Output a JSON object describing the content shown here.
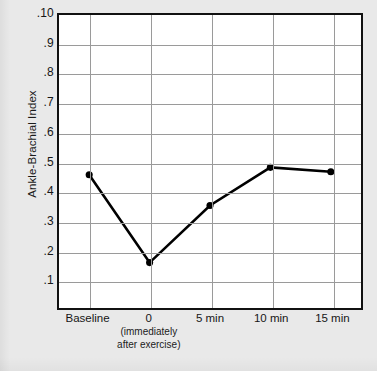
{
  "chart_data": {
    "type": "line",
    "title": "",
    "subtitle": "",
    "xlabel": "",
    "ylabel": "Ankle-Brachial Index",
    "categories": [
      "Baseline",
      "0",
      "5 min",
      "10 min",
      "15 min"
    ],
    "category_sublabels": [
      "",
      "(immediately\nafter exercise)",
      "",
      "",
      ""
    ],
    "values": [
      0.455,
      0.155,
      0.35,
      0.48,
      0.465
    ],
    "series": [
      {
        "name": "Ankle-Brachial Index",
        "values": [
          0.455,
          0.155,
          0.35,
          0.48,
          0.465
        ]
      }
    ],
    "ylim": [
      0,
      1.0
    ],
    "y_tick_labels": [
      ".10",
      ".9",
      ".8",
      ".7",
      ".6",
      ".5",
      ".4",
      ".3",
      ".2",
      ".1"
    ],
    "y_tick_values": [
      1.0,
      0.9,
      0.8,
      0.7,
      0.6,
      0.5,
      0.4,
      0.3,
      0.2,
      0.1
    ],
    "grid": true,
    "grid_axis": "both",
    "legend": false,
    "legend_position": "none",
    "marker": "filled-circle",
    "line_color": "#000000",
    "marker_color": "#000000",
    "grid_color": "#9a9a9a",
    "frame_color": "#111111",
    "plot_background": "#ffffff",
    "page_background": "#e9e9e9"
  },
  "axes": {
    "y_title": "Ankle-Brachial Index",
    "x_labels": [
      {
        "label": "Baseline",
        "sub_line1": "",
        "sub_line2": ""
      },
      {
        "label": "0",
        "sub_line1": "(immediately",
        "sub_line2": "after exercise)"
      },
      {
        "label": "5 min",
        "sub_line1": "",
        "sub_line2": ""
      },
      {
        "label": "10 min",
        "sub_line1": "",
        "sub_line2": ""
      },
      {
        "label": "15 min",
        "sub_line1": "",
        "sub_line2": ""
      }
    ],
    "y_labels": [
      ".10",
      ".9",
      ".8",
      ".7",
      ".6",
      ".5",
      ".4",
      ".3",
      ".2",
      ".1"
    ]
  }
}
